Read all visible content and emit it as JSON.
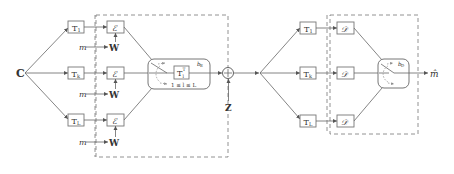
{
  "diagram": {
    "input": {
      "label": "C"
    },
    "encoder_side": {
      "branches": [
        {
          "transform": "T",
          "transform_sub": "1",
          "encoder": "ℰ",
          "message": "m",
          "watermark": "W"
        },
        {
          "transform": "T",
          "transform_sub": "k",
          "encoder": "ℰ",
          "message": "m",
          "watermark": "W"
        },
        {
          "transform": "T",
          "transform_sub": "L",
          "encoder": "ℰ",
          "message": "m",
          "watermark": "W"
        }
      ],
      "selector": {
        "inverse_transform": "T",
        "inverse_sup": "T",
        "inverse_sub": "l",
        "index_label": "b",
        "index_sub": "E",
        "range_label": "1 ≤ l ≤ L"
      }
    },
    "channel": {
      "adder_symbol": "+",
      "noise_label": "Z"
    },
    "decoder_side": {
      "branches": [
        {
          "transform": "T",
          "transform_sub": "1",
          "decoder": "𝒟"
        },
        {
          "transform": "T",
          "transform_sub": "k",
          "decoder": "𝒟"
        },
        {
          "transform": "T",
          "transform_sub": "L",
          "decoder": "𝒟"
        }
      ],
      "selector": {
        "index_label": "b",
        "index_sub": "D"
      },
      "output": {
        "label": "m̂"
      }
    },
    "colors": {
      "stroke": "#666666",
      "text": "#333333",
      "background": "#ffffff"
    }
  }
}
